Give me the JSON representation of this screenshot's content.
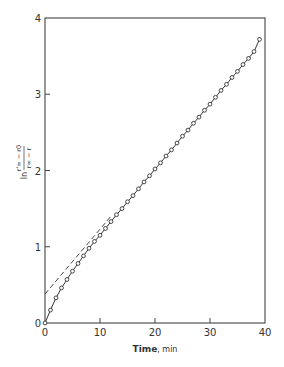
{
  "chart_data": {
    "type": "line",
    "title": "",
    "xlabel": "Time, min",
    "xlabel_bold": "Time",
    "xlabel_unit": ", min",
    "ylabel": "ln (r'∞ − r0)/(r∞ − r)",
    "ylabel_parts": {
      "prefix": "ln",
      "numerator": "r'∞ − r0",
      "denominator": "r∞ − r"
    },
    "xlim": [
      0,
      40
    ],
    "ylim": [
      0,
      4
    ],
    "xticks": [
      "0",
      "10",
      "20",
      "30",
      "40"
    ],
    "yticks": [
      "0",
      "1",
      "2",
      "3",
      "4"
    ],
    "grid": false,
    "legend": "none",
    "series": [
      {
        "name": "measured",
        "style": "solid line with open circle markers",
        "x": [
          0,
          1,
          2,
          3,
          4,
          5,
          6,
          7,
          8,
          9,
          10,
          11,
          12,
          13,
          14,
          15,
          16,
          17,
          18,
          19,
          20,
          21,
          22,
          23,
          24,
          25,
          26,
          27,
          28,
          29,
          30,
          31,
          32,
          33,
          34,
          35,
          36,
          37,
          38,
          39
        ],
        "y": [
          0.0,
          0.17,
          0.33,
          0.46,
          0.57,
          0.68,
          0.78,
          0.88,
          0.98,
          1.07,
          1.15,
          1.24,
          1.33,
          1.42,
          1.5,
          1.59,
          1.67,
          1.76,
          1.85,
          1.93,
          2.02,
          2.1,
          2.19,
          2.27,
          2.36,
          2.45,
          2.53,
          2.62,
          2.7,
          2.79,
          2.87,
          2.96,
          3.05,
          3.13,
          3.22,
          3.3,
          3.39,
          3.47,
          3.56,
          3.72
        ]
      },
      {
        "name": "linear extrapolation",
        "style": "dashed line",
        "x": [
          0,
          12
        ],
        "y": [
          0.38,
          1.4
        ]
      }
    ]
  }
}
